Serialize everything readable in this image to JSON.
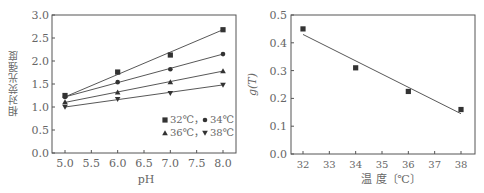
{
  "chart_data": [
    {
      "type": "line",
      "title": "",
      "xlabel": "pH",
      "ylabel": "相对荧光强度",
      "x": [
        5.0,
        6.0,
        7.0,
        8.0
      ],
      "xticks": [
        "5.0",
        "5.5",
        "6.0",
        "6.5",
        "7.0",
        "7.5",
        "8.0"
      ],
      "yticks": [
        "0.0",
        "0.5",
        "1.0",
        "1.5",
        "2.0",
        "2.5",
        "3.0"
      ],
      "xlim": [
        4.78,
        8.25
      ],
      "ylim": [
        0,
        3.0
      ],
      "grid": false,
      "legend_position": "lower right",
      "legend_rows": [
        [
          "32℃",
          "34℃"
        ],
        [
          "36℃",
          "38℃"
        ]
      ],
      "series": [
        {
          "name": "32℃",
          "marker": "square",
          "values": [
            1.25,
            1.76,
            2.13,
            2.68
          ],
          "fit": [
            1.22,
            2.68
          ]
        },
        {
          "name": "34℃",
          "marker": "circle",
          "values": [
            1.22,
            1.54,
            1.82,
            2.15
          ],
          "fit": [
            1.22,
            2.15
          ]
        },
        {
          "name": "36℃",
          "marker": "triangle-up",
          "values": [
            1.11,
            1.32,
            1.54,
            1.78
          ],
          "fit": [
            1.1,
            1.78
          ]
        },
        {
          "name": "38℃",
          "marker": "triangle-down",
          "values": [
            1.0,
            1.17,
            1.3,
            1.48
          ],
          "fit": [
            1.0,
            1.48
          ]
        }
      ]
    },
    {
      "type": "scatter",
      "title": "",
      "xlabel": "温  度〔℃〕",
      "ylabel": "g(T)",
      "x": [
        32,
        34,
        36,
        38
      ],
      "xticks": [
        "32",
        "33",
        "34",
        "35",
        "36",
        "37",
        "38"
      ],
      "yticks": [
        "0.0",
        "0.1",
        "0.2",
        "0.3",
        "0.4",
        "0.5"
      ],
      "xlim": [
        31.5,
        38.4
      ],
      "ylim": [
        0,
        0.5
      ],
      "grid": false,
      "series": [
        {
          "name": "g(T)",
          "marker": "square",
          "values": [
            0.45,
            0.31,
            0.225,
            0.16
          ]
        }
      ],
      "fit_line": {
        "x": [
          32,
          38
        ],
        "y": [
          0.43,
          0.145
        ]
      }
    }
  ],
  "left": {
    "xlabel": "pH",
    "ylabel": "相对荧光强度",
    "legend_line1": "32℃，",
    "legend_line1b": "34℃",
    "legend_line2": "36℃，",
    "legend_line2b": "38℃"
  },
  "right": {
    "xlabel": "温  度〔℃〕",
    "ylabel_g": "g",
    "ylabel_t": "(T)"
  },
  "colors": {
    "axis": "#555555",
    "line": "#444444",
    "marker": "#333333",
    "tick_text": "#666666"
  }
}
